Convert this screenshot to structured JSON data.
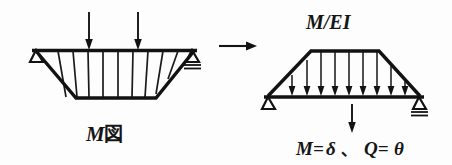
{
  "figure": {
    "title_left": "M 図",
    "title_left_symbol": "M",
    "title_left_kanji": "図",
    "title_right": "M/EI",
    "result_formula": "M= δ 、 Q= θ",
    "formula_parts": {
      "moment": "M=",
      "deflection": "δ",
      "separator": "、",
      "shear": "Q=",
      "rotation": "θ"
    },
    "ink_color": "#121212",
    "background_color": "#fdfdfd"
  },
  "left_diagram": {
    "name": "bending-moment-diagram",
    "caption": "M 図",
    "shape": "inverted-trapezoid",
    "beam": {
      "x1": 32,
      "x2": 197,
      "y": 50
    },
    "trapezoid_bottom": {
      "x1": 76,
      "x2": 156,
      "y": 98
    },
    "hatch_line_count": 9,
    "point_loads": [
      {
        "label": "",
        "x": 89,
        "y_top": 12,
        "y_tip": 48
      },
      {
        "label": "",
        "x": 138,
        "y_top": 12,
        "y_tip": 48
      }
    ],
    "supports": [
      {
        "type": "pin",
        "position": "left",
        "x": 35,
        "y": 50
      },
      {
        "type": "roller",
        "position": "right",
        "x": 193,
        "y": 50
      }
    ]
  },
  "right_diagram": {
    "name": "elastic-load-diagram",
    "caption": "M/EI",
    "shape": "upright-trapezoid",
    "beam": {
      "x1": 264,
      "x2": 424,
      "y": 97
    },
    "trapezoid_top": {
      "x1": 311,
      "x2": 379,
      "y": 50
    },
    "distributed_load_arrow_count": 10,
    "supports": [
      {
        "type": "pin",
        "position": "left",
        "x": 268,
        "y": 97
      },
      {
        "type": "roller",
        "position": "right",
        "x": 420,
        "y": 97
      }
    ],
    "result_arrow": {
      "x": 352,
      "y_top": 104,
      "y_tip": 133
    }
  },
  "transition": {
    "name": "transformation-arrow",
    "direction": "right",
    "x1": 219,
    "x2": 256,
    "y": 46
  }
}
